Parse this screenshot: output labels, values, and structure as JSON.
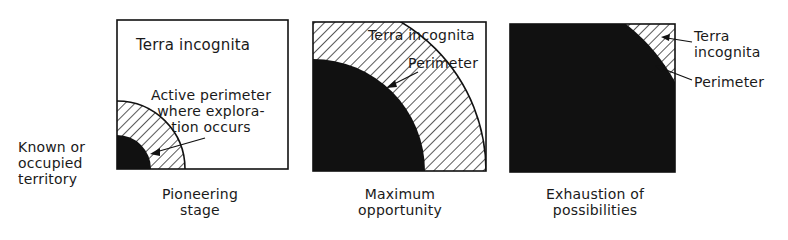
{
  "diagram": {
    "type": "three-panel conceptual diagram",
    "panels": [
      {
        "id": "pioneering",
        "caption_line1": "Pioneering",
        "caption_line2": "stage",
        "terra_label": "Terra incognita",
        "perimeter_label_line1": "Active perimeter",
        "perimeter_label_line2": "where explora-",
        "perimeter_label_line3": "tion occurs"
      },
      {
        "id": "maximum",
        "caption_line1": "Maximum",
        "caption_line2": "opportunity",
        "terra_label": "Terra incognita",
        "perimeter_label": "Perimeter"
      },
      {
        "id": "exhaustion",
        "caption_line1": "Exhaustion of",
        "caption_line2": "possibilities",
        "terra_label_line1": "Terra",
        "terra_label_line2": "incognita",
        "perimeter_label": "Perimeter"
      }
    ],
    "known_label_line1": "Known or",
    "known_label_line2": "occupied",
    "known_label_line3": "territory",
    "colors": {
      "ink": "#111111",
      "background": "#ffffff"
    }
  }
}
